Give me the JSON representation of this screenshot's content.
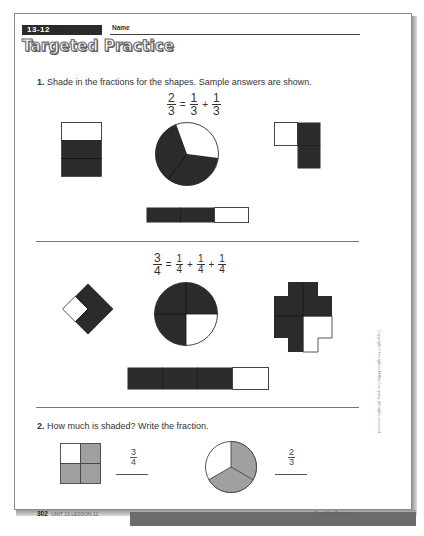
{
  "header": {
    "lesson_code": "13-12",
    "name_label": "Name",
    "title": "Targeted Practice"
  },
  "question1": {
    "number": "1.",
    "prompt": "Shade in the fractions for the shapes. Sample answers are shown.",
    "part_a": {
      "equation": {
        "lhs": {
          "num": "2",
          "den": "3"
        },
        "terms": [
          {
            "num": "1",
            "den": "3"
          },
          {
            "num": "1",
            "den": "3"
          }
        ],
        "equals": "=",
        "plus": "+"
      },
      "shapes": [
        {
          "type": "rectangle",
          "parts": 3,
          "shaded": 2
        },
        {
          "type": "circle",
          "parts": 3,
          "shaded": 2
        },
        {
          "type": "L-shape",
          "parts": 3,
          "shaded": 2
        },
        {
          "type": "bar",
          "parts": 3,
          "shaded": 2
        }
      ]
    },
    "part_b": {
      "equation": {
        "lhs": {
          "num": "3",
          "den": "4"
        },
        "terms": [
          {
            "num": "1",
            "den": "4"
          },
          {
            "num": "1",
            "den": "4"
          },
          {
            "num": "1",
            "den": "4"
          }
        ],
        "equals": "=",
        "plus": "+"
      },
      "shapes": [
        {
          "type": "diamond",
          "parts": 4,
          "shaded": 3
        },
        {
          "type": "circle",
          "parts": 4,
          "shaded": 3
        },
        {
          "type": "cross",
          "parts": 4,
          "shaded": 3
        },
        {
          "type": "bar",
          "parts": 4,
          "shaded": 3
        }
      ]
    }
  },
  "question2": {
    "number": "2.",
    "prompt": "How much is shaded? Write the fraction.",
    "items": [
      {
        "shape": "square",
        "parts": 4,
        "shaded": 3,
        "answer": {
          "num": "3",
          "den": "4"
        }
      },
      {
        "shape": "circle",
        "parts": 3,
        "shaded": 2,
        "answer": {
          "num": "2",
          "den": "3"
        }
      }
    ]
  },
  "side_text": "Copyright © Houghton Mifflin Company. All rights reserved.",
  "footer": {
    "page_number": "302",
    "unit_lesson": "UNIT 13 LESSON 12",
    "right_text": "Possible Outcomes"
  },
  "colors": {
    "dark_fill": "#2b2b2b",
    "gray_fill": "#a0a0a0",
    "outline": "#444444"
  }
}
